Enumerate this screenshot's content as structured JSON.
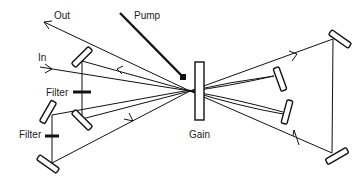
{
  "diagram": {
    "labels": {
      "out": "Out",
      "pump": "Pump",
      "in": "In",
      "filter_upper": "Filter",
      "filter_lower": "Filter",
      "gain": "Gain"
    },
    "components": [
      {
        "name": "gain-medium",
        "type": "gain"
      },
      {
        "name": "pump-beam",
        "type": "pump"
      },
      {
        "name": "mirror-upper-left",
        "type": "mirror"
      },
      {
        "name": "mirror-left-mid",
        "type": "mirror"
      },
      {
        "name": "mirror-left-outer",
        "type": "mirror"
      },
      {
        "name": "mirror-bottom-left",
        "type": "mirror"
      },
      {
        "name": "mirror-center-right-upper",
        "type": "mirror"
      },
      {
        "name": "mirror-center-right-lower",
        "type": "mirror"
      },
      {
        "name": "mirror-far-right-top",
        "type": "mirror"
      },
      {
        "name": "mirror-far-right-bottom",
        "type": "mirror"
      },
      {
        "name": "filter-upper",
        "type": "filter"
      },
      {
        "name": "filter-lower",
        "type": "filter"
      }
    ],
    "colors": {
      "line": "#111111",
      "background": "#ffffff",
      "text": "#222222"
    }
  }
}
